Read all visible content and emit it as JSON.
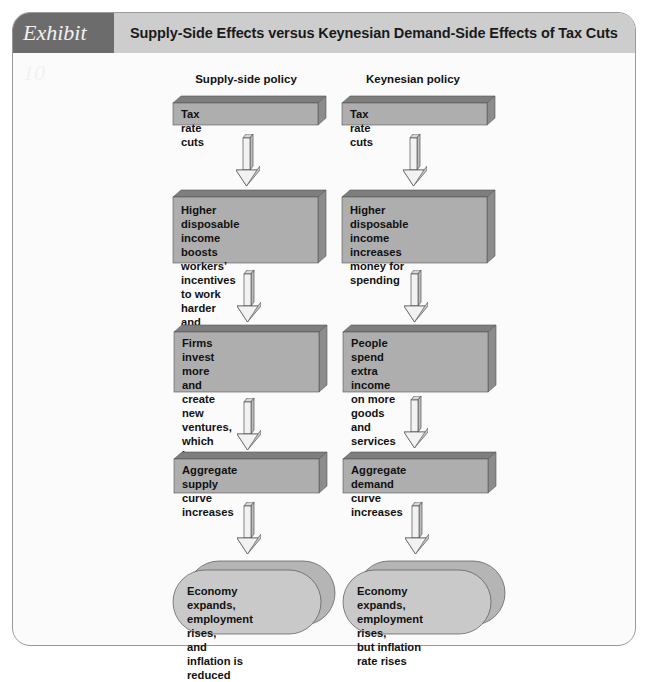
{
  "exhibit": {
    "label": "Exhibit 10",
    "title": "Supply-Side Effects versus Keynesian Demand-Side Effects of Tax Cuts"
  },
  "colors": {
    "tab": "#6c6c6c",
    "header_bar": "#cdcdcd",
    "box_front": "#aeaeae",
    "box_top": "#7e7e7e",
    "box_side": "#8c8c8c",
    "oval_front": "#c9c9c9",
    "oval_back": "#b5b5b5",
    "arrow_fill": "#f0f0f0"
  },
  "columns": [
    {
      "heading": "Supply-side policy",
      "steps": [
        "Tax rate cuts",
        "Higher disposable\nincome boosts workers’\nincentives to work harder\nand produce more",
        "Firms invest more and\ncreate new ventures,\nwhich increase jobs and\noutput",
        "Aggregate supply curve\nincreases"
      ],
      "outcome": "Economy expands,\nemployment rises,\nand inflation is reduced"
    },
    {
      "heading": "Keynesian policy",
      "steps": [
        "Tax rate cuts",
        "Higher disposable\nincome increases\nmoney for spending",
        "People spend extra\nincome on more goods\nand services",
        "Aggregate demand curve\nincreases"
      ],
      "outcome": "Economy expands,\nemployment rises,\nbut inflation rate rises"
    }
  ]
}
